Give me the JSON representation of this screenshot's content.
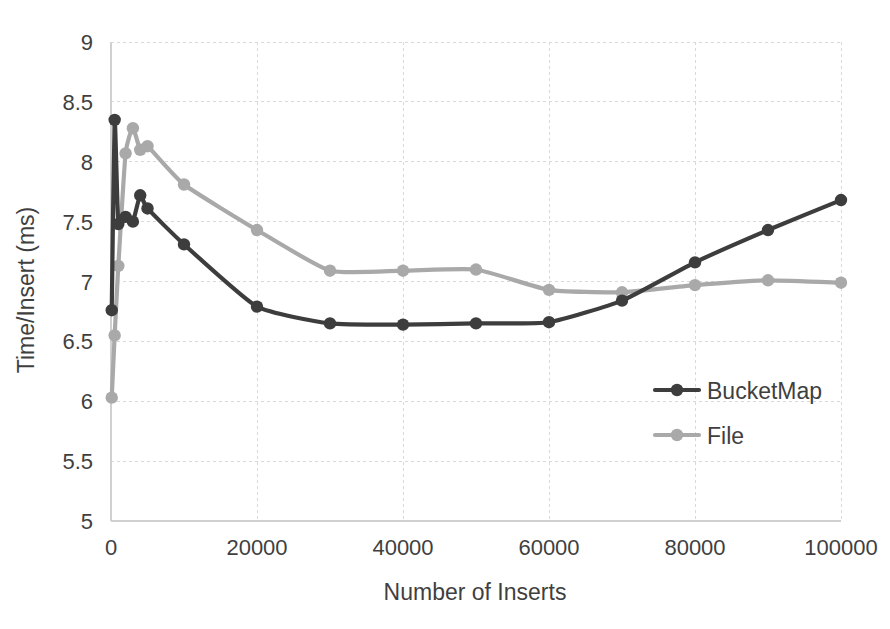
{
  "chart_data": {
    "type": "line",
    "title": "",
    "xlabel": "Number of Inserts",
    "ylabel": "Time/Insert (ms)",
    "xlim": [
      0,
      100000
    ],
    "ylim": [
      5,
      9
    ],
    "xticks": [
      0,
      20000,
      40000,
      60000,
      80000,
      100000
    ],
    "xtick_labels": [
      "0",
      "20000",
      "40000",
      "60000",
      "80000",
      "100000"
    ],
    "yticks": [
      5,
      5.5,
      6,
      6.5,
      7,
      7.5,
      8,
      8.5,
      9
    ],
    "ytick_labels": [
      "5",
      "5.5",
      "6",
      "6.5",
      "7",
      "7.5",
      "8",
      "8.5",
      "9"
    ],
    "grid": true,
    "grid_style": "dotted",
    "legend_position": "center-right-inside",
    "legend_border": false,
    "x": [
      100,
      500,
      1000,
      2000,
      3000,
      4000,
      5000,
      10000,
      20000,
      30000,
      40000,
      50000,
      60000,
      70000,
      80000,
      90000,
      100000
    ],
    "series": [
      {
        "name": "BucketMap",
        "color": "#3d3d3d",
        "marker": "circle",
        "values": [
          6.76,
          8.35,
          7.48,
          7.54,
          7.5,
          7.72,
          7.61,
          7.31,
          6.79,
          6.65,
          6.64,
          6.65,
          6.66,
          6.84,
          7.16,
          7.43,
          7.68
        ]
      },
      {
        "name": "File",
        "color": "#a9a9a9",
        "marker": "circle",
        "values": [
          6.03,
          6.55,
          7.13,
          8.07,
          8.28,
          8.1,
          8.13,
          7.81,
          7.43,
          7.09,
          7.09,
          7.1,
          6.93,
          6.91,
          6.97,
          7.01,
          6.99
        ]
      }
    ]
  },
  "legend": {
    "entries": [
      {
        "label": "BucketMap"
      },
      {
        "label": "File"
      }
    ]
  },
  "axes": {
    "x_title": "Number of Inserts",
    "y_title": "Time/Insert (ms)"
  }
}
